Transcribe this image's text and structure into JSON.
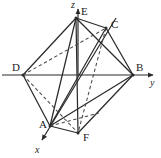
{
  "figure": {
    "width": 161,
    "height": 158,
    "background_color": "#ffffff",
    "stroke_color": "#2b2b2b",
    "label_color": "#222222"
  },
  "axes": {
    "origin": {
      "x": 78,
      "y": 75
    },
    "items": [
      {
        "name": "z",
        "label": "z",
        "label_x": 72,
        "label_y": 1,
        "line": {
          "x1": 78,
          "y1": 75,
          "x2": 78,
          "y2": 8
        },
        "arrow": true,
        "direction": "up"
      },
      {
        "name": "y",
        "label": "y",
        "label_x": 150,
        "label_y": 80,
        "line": {
          "x1": 2,
          "y1": 75,
          "x2": 155,
          "y2": 75
        },
        "arrow": true,
        "direction": "right"
      },
      {
        "name": "x",
        "label": "x",
        "label_x": 35,
        "label_y": 146,
        "line": {
          "x1": 116,
          "y1": 18,
          "x2": 41,
          "y2": 142
        },
        "arrow": true,
        "direction": "down-left"
      }
    ]
  },
  "vertices": [
    {
      "name": "A",
      "label": "A",
      "x": 50,
      "y": 126,
      "label_x": 39,
      "label_y": 121
    },
    {
      "name": "B",
      "label": "B",
      "x": 133,
      "y": 75,
      "label_x": 136,
      "label_y": 63
    },
    {
      "name": "C",
      "label": "C",
      "x": 106,
      "y": 28,
      "label_x": 111,
      "label_y": 20
    },
    {
      "name": "D",
      "label": "D",
      "x": 23,
      "y": 75,
      "label_x": 12,
      "label_y": 63
    },
    {
      "name": "E",
      "label": "E",
      "x": 76,
      "y": 18,
      "label_x": 81,
      "label_y": 7
    },
    {
      "name": "F",
      "label": "F",
      "x": 78,
      "y": 133,
      "label_x": 83,
      "label_y": 133
    }
  ],
  "edges": [
    {
      "name": "edge-D-E",
      "from": "D",
      "to": "E",
      "style": "solid"
    },
    {
      "name": "edge-E-C",
      "from": "E",
      "to": "C",
      "style": "solid"
    },
    {
      "name": "edge-C-B",
      "from": "C",
      "to": "B",
      "style": "solid"
    },
    {
      "name": "edge-B-A",
      "from": "B",
      "to": "A",
      "style": "solid"
    },
    {
      "name": "edge-A-D",
      "from": "A",
      "to": "D",
      "style": "solid"
    },
    {
      "name": "edge-D-F",
      "from": "D",
      "to": "F",
      "style": "dashed"
    },
    {
      "name": "edge-F-B",
      "from": "F",
      "to": "B",
      "style": "solid"
    },
    {
      "name": "edge-A-F",
      "from": "A",
      "to": "F",
      "style": "solid"
    },
    {
      "name": "edge-A-E",
      "from": "A",
      "to": "E",
      "style": "solid"
    },
    {
      "name": "edge-E-B",
      "from": "E",
      "to": "B",
      "style": "solid"
    },
    {
      "name": "edge-E-F",
      "from": "E",
      "to": "F",
      "style": "solid"
    },
    {
      "name": "edge-D-C",
      "from": "D",
      "to": "C",
      "style": "dashed"
    },
    {
      "name": "edge-C-F",
      "from": "C",
      "to": "F",
      "style": "dashed"
    },
    {
      "name": "edge-C-A",
      "from": "C",
      "to": "A",
      "style": "solid"
    },
    {
      "name": "edge-A-C-dashed",
      "from": "A",
      "to": "C",
      "style": "dashed"
    }
  ]
}
